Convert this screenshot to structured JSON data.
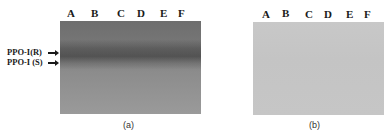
{
  "figure": {
    "panel_a": {
      "lanes": [
        "A",
        "B",
        "C",
        "D",
        "E",
        "F"
      ],
      "markers": [
        "PPO-I(R)",
        "PPO-I (S)"
      ],
      "caption": "(a)"
    },
    "panel_b": {
      "lanes": [
        "A",
        "B",
        "C",
        "D",
        "E",
        "F"
      ],
      "caption": "(b)"
    }
  }
}
